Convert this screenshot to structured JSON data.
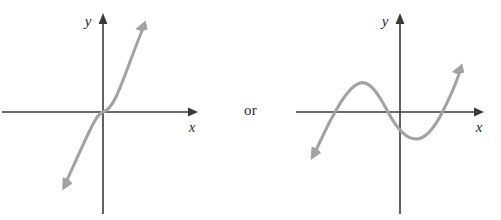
{
  "figure": {
    "title": "",
    "background_color": "#ffffff",
    "axis_color": "#3a3a3a",
    "curve_color": "#a2a2a2",
    "text_color": "#2b2b2b",
    "connector_label": "or"
  },
  "panels": [
    {
      "id": "left",
      "name": "increasing-cubic-graph",
      "description": "odd-degree polynomial rising left to right through origin",
      "axes": {
        "x_label": "x",
        "y_label": "y",
        "origin": {
          "x": 103,
          "y": 112
        },
        "x_axis_from": {
          "x": 2,
          "y": 112
        },
        "x_axis_to": {
          "x": 198,
          "y": 112
        },
        "y_axis_from": {
          "x": 103,
          "y": 214
        },
        "y_axis_to": {
          "x": 103,
          "y": 14
        }
      },
      "curve": {
        "start_arrow": {
          "x": 62,
          "y": 188
        },
        "end_arrow": {
          "x": 146,
          "y": 22
        },
        "passes_through_origin": true,
        "end_behavior_left": "down",
        "end_behavior_right": "up",
        "turning_points": 0
      }
    },
    {
      "id": "right",
      "name": "wavy-cubic-graph",
      "description": "odd-degree polynomial with local maximum and local minimum",
      "axes": {
        "x_label": "x",
        "y_label": "y",
        "origin": {
          "x": 400,
          "y": 112
        },
        "x_axis_from": {
          "x": 296,
          "y": 112
        },
        "x_axis_to": {
          "x": 484,
          "y": 112
        },
        "y_axis_from": {
          "x": 400,
          "y": 214
        },
        "y_axis_to": {
          "x": 400,
          "y": 14
        }
      },
      "curve": {
        "start_arrow": {
          "x": 312,
          "y": 157
        },
        "end_arrow": {
          "x": 462,
          "y": 65
        },
        "local_maximum": {
          "x": 360,
          "y": 83
        },
        "local_minimum": {
          "x": 416,
          "y": 139
        },
        "x_intercepts": [
          {
            "x": 334,
            "y": 112
          },
          {
            "x": 388,
            "y": 112
          },
          {
            "x": 442,
            "y": 112
          }
        ],
        "end_behavior_left": "down",
        "end_behavior_right": "up",
        "turning_points": 2
      }
    }
  ]
}
